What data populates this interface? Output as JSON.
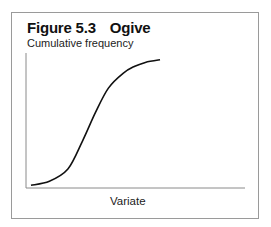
{
  "figure": {
    "label": "Figure 5.3",
    "name": "Ogive"
  },
  "chart_data": {
    "type": "line",
    "title": "Figure 5.3 Ogive",
    "xlabel": "Variate",
    "ylabel": "Cumulative frequency",
    "grid": false,
    "legend": null,
    "ticks": {
      "x": [],
      "y": []
    },
    "series": [
      {
        "name": "Cumulative frequency",
        "x": [
          0.0,
          0.1,
          0.2,
          0.28,
          0.35,
          0.42,
          0.5,
          0.56,
          0.62,
          0.7
        ],
        "y": [
          0.02,
          0.05,
          0.14,
          0.35,
          0.56,
          0.74,
          0.85,
          0.9,
          0.93,
          0.95
        ]
      }
    ],
    "xlim": [
      0,
      1
    ],
    "ylim": [
      0,
      1
    ]
  }
}
